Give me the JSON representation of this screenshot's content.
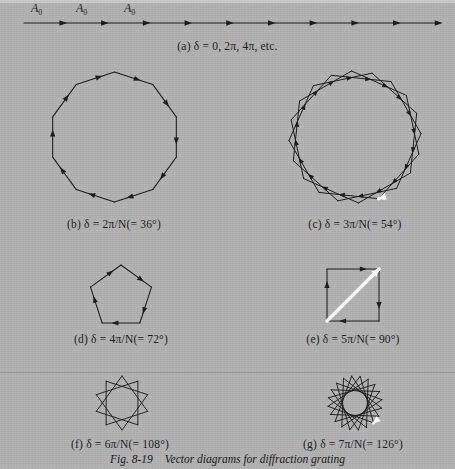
{
  "figure": {
    "number": "Fig. 8-19",
    "title": "Vector diagrams for diffraction grating",
    "background_color": "#b2b2b2",
    "ink_color": "#1a1a1a",
    "resultant_color": "#ffffff"
  },
  "vector_labels": [
    {
      "text": "A",
      "sub": "0"
    },
    {
      "text": "A",
      "sub": "0"
    },
    {
      "text": "A",
      "sub": "0"
    }
  ],
  "panels": [
    {
      "key": "a",
      "label": "(a)",
      "caption": "(a)  δ = 0, 2π, 4π, etc.",
      "delta_text": "δ = 0, 2π, 4π, etc.",
      "turn_degrees": 0,
      "n_vectors": 10,
      "shape": "straight-line",
      "resultant": false
    },
    {
      "key": "b",
      "label": "(b)",
      "caption": "(b)  δ = 2π/N(= 36°)",
      "delta_text": "δ = 2π/N(= 36°)",
      "turn_degrees": 36,
      "n_vectors": 10,
      "shape": "decagon",
      "resultant": false
    },
    {
      "key": "c",
      "label": "(c)",
      "caption": "(c)  δ = 3π/N(= 54°)",
      "delta_text": "δ = 3π/N(= 54°)",
      "turn_degrees": 54,
      "n_vectors": 20,
      "shape": "star-polygon",
      "resultant": true
    },
    {
      "key": "d",
      "label": "(d)",
      "caption": "(d)  δ = 4π/N(= 72°)",
      "delta_text": "δ = 4π/N(= 72°)",
      "turn_degrees": 72,
      "n_vectors": 5,
      "shape": "pentagon",
      "resultant": false
    },
    {
      "key": "e",
      "label": "(e)",
      "caption": "(e)  δ = 5π/N(= 90°)",
      "delta_text": "δ = 5π/N(= 90°)",
      "turn_degrees": 90,
      "n_vectors": 4,
      "shape": "square",
      "resultant": true
    },
    {
      "key": "f",
      "label": "(f)",
      "caption": "(f)  δ = 6π/N(= 108°)",
      "delta_text": "δ = 6π/N(= 108°)",
      "turn_degrees": 108,
      "n_vectors": 10,
      "shape": "star-polygon-10",
      "resultant": false
    },
    {
      "key": "g",
      "label": "(g)",
      "caption": "(g)  δ = 7π/N(= 126°)",
      "delta_text": "δ = 7π/N(= 126°)",
      "turn_degrees": 126,
      "n_vectors": 20,
      "shape": "star-polygon-20",
      "resultant": true
    }
  ]
}
